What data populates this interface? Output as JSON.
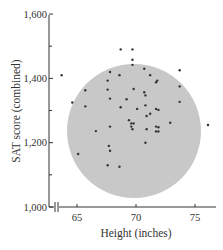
{
  "chart_data": {
    "type": "scatter",
    "title": "",
    "xlabel": "Height (inches)",
    "ylabel": "SAT score (combined)",
    "xlim": [
      62.5,
      77
    ],
    "ylim": [
      1000,
      1600
    ],
    "x_ticks": [
      65,
      70,
      75
    ],
    "x_tick_labels": [
      "65",
      "70",
      "75"
    ],
    "y_ticks": [
      1000,
      1200,
      1400,
      1600
    ],
    "y_tick_labels": [
      "1,000",
      "1,200",
      "1,400",
      "1,600"
    ],
    "y_minor_ticks": [
      1100,
      1300,
      1500
    ],
    "x_axis_break": true,
    "grid": false,
    "legend": null,
    "annotation": {
      "shape": "circle",
      "fill": "#c8c8c8",
      "center": {
        "x": 69.8,
        "y": 1315
      },
      "radius_px": 67,
      "description": "Shaded circular region enclosing the bulk of the points"
    },
    "series": [
      {
        "name": "students",
        "color": "#333333",
        "points": [
          {
            "x": 63.7,
            "y": 1410
          },
          {
            "x": 64.6,
            "y": 1325
          },
          {
            "x": 65.1,
            "y": 1165
          },
          {
            "x": 65.7,
            "y": 1363
          },
          {
            "x": 65.7,
            "y": 1313
          },
          {
            "x": 66.6,
            "y": 1236
          },
          {
            "x": 67.6,
            "y": 1130
          },
          {
            "x": 67.6,
            "y": 1365
          },
          {
            "x": 67.6,
            "y": 1393
          },
          {
            "x": 67.8,
            "y": 1420
          },
          {
            "x": 67.8,
            "y": 1337
          },
          {
            "x": 67.8,
            "y": 1250
          },
          {
            "x": 67.7,
            "y": 1190
          },
          {
            "x": 67.8,
            "y": 1175
          },
          {
            "x": 68.6,
            "y": 1125
          },
          {
            "x": 68.6,
            "y": 1410
          },
          {
            "x": 68.7,
            "y": 1310
          },
          {
            "x": 68.7,
            "y": 1490
          },
          {
            "x": 69.2,
            "y": 1335
          },
          {
            "x": 69.4,
            "y": 1270
          },
          {
            "x": 69.6,
            "y": 1260
          },
          {
            "x": 69.6,
            "y": 1250
          },
          {
            "x": 69.7,
            "y": 1242
          },
          {
            "x": 69.8,
            "y": 1260
          },
          {
            "x": 69.7,
            "y": 1490
          },
          {
            "x": 69.7,
            "y": 1458
          },
          {
            "x": 69.7,
            "y": 1442
          },
          {
            "x": 69.8,
            "y": 1367
          },
          {
            "x": 70.1,
            "y": 1305
          },
          {
            "x": 70.7,
            "y": 1430
          },
          {
            "x": 70.7,
            "y": 1357
          },
          {
            "x": 70.8,
            "y": 1347
          },
          {
            "x": 70.8,
            "y": 1316
          },
          {
            "x": 70.9,
            "y": 1283
          },
          {
            "x": 70.9,
            "y": 1242
          },
          {
            "x": 70.8,
            "y": 1200
          },
          {
            "x": 71.2,
            "y": 1410
          },
          {
            "x": 71.2,
            "y": 1290
          },
          {
            "x": 71.7,
            "y": 1388
          },
          {
            "x": 71.8,
            "y": 1393
          },
          {
            "x": 71.7,
            "y": 1305
          },
          {
            "x": 71.9,
            "y": 1302
          },
          {
            "x": 71.7,
            "y": 1250
          },
          {
            "x": 71.7,
            "y": 1235
          },
          {
            "x": 71.9,
            "y": 1248
          },
          {
            "x": 71.9,
            "y": 1235
          },
          {
            "x": 72.9,
            "y": 1262
          },
          {
            "x": 73.7,
            "y": 1425
          },
          {
            "x": 73.7,
            "y": 1375
          },
          {
            "x": 73.7,
            "y": 1327
          },
          {
            "x": 76.1,
            "y": 1255
          }
        ]
      }
    ]
  }
}
